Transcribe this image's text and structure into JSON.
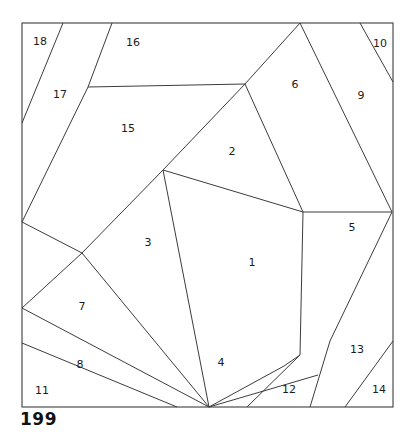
{
  "figure": {
    "caption": "199",
    "frame": {
      "x": 22,
      "y": 23,
      "width": 371,
      "height": 384
    },
    "stroke_color": "#3c3c3c",
    "fill_color": "#ffffff",
    "label_color": "#1b1b1b",
    "region_count": 18
  },
  "chart_data": {
    "type": "diagram",
    "title": "199",
    "regions": [
      {
        "id": "1",
        "label": "1",
        "label_x": 252,
        "label_y": 263,
        "points": "163,170 303,212 300,355 284,366 209,407"
      },
      {
        "id": "2",
        "label": "2",
        "label_x": 232,
        "label_y": 152,
        "points": "163,170 245,84 303,212"
      },
      {
        "id": "3",
        "label": "3",
        "label_x": 148,
        "label_y": 243,
        "points": "163,170 82,253 209,407"
      },
      {
        "id": "4",
        "label": "4",
        "label_x": 221,
        "label_y": 363,
        "points": "209,407 284,366 300,355 318,375 209,407"
      },
      {
        "id": "5",
        "label": "5",
        "label_x": 352,
        "label_y": 228,
        "points": "303,212 392,212 330,341 300,355"
      },
      {
        "id": "6",
        "label": "6",
        "label_x": 295,
        "label_y": 85,
        "points": "245,84 300,23 338,212 303,212"
      },
      {
        "id": "7",
        "label": "7",
        "label_x": 82,
        "label_y": 307,
        "points": "82,253 22,308 209,407"
      },
      {
        "id": "8",
        "label": "8",
        "label_x": 80,
        "label_y": 365,
        "points": "22,308 22,343 177,407 209,407"
      },
      {
        "id": "9",
        "label": "9",
        "label_x": 361,
        "label_y": 96,
        "points": "300,23 360,23 392,212 338,212"
      },
      {
        "id": "10",
        "label": "10",
        "label_x": 380,
        "label_y": 44,
        "points": "360,23 393,23 393,82"
      },
      {
        "id": "11",
        "label": "11",
        "label_x": 42,
        "label_y": 391,
        "points": "22,343 22,407 177,407"
      },
      {
        "id": "12",
        "label": "12",
        "label_x": 289,
        "label_y": 390,
        "points": "318,375 300,355 310,407 247,407"
      },
      {
        "id": "13",
        "label": "13",
        "label_x": 357,
        "label_y": 350,
        "points": "330,341 392,212 393,341 345,407 310,407"
      },
      {
        "id": "14",
        "label": "14",
        "label_x": 379,
        "label_y": 390,
        "points": "393,341 393,407 345,407"
      },
      {
        "id": "15",
        "label": "15",
        "label_x": 128,
        "label_y": 129,
        "points": "88,87 245,84 163,170 82,253 22,222"
      },
      {
        "id": "16",
        "label": "16",
        "label_x": 133,
        "label_y": 43,
        "points": "88,87 112,23 300,23 245,84"
      },
      {
        "id": "17",
        "label": "17",
        "label_x": 60,
        "label_y": 95,
        "points": "63,23 112,23 88,87 22,222 22,123"
      },
      {
        "id": "18",
        "label": "18",
        "label_x": 40,
        "label_y": 42,
        "points": "22,23 63,23 22,123"
      }
    ],
    "edges": [
      {
        "name": "edge-18-17",
        "points": "63,23 22,123"
      },
      {
        "name": "edge-17-16",
        "points": "112,23 88,87 22,222"
      },
      {
        "name": "edge-16-15",
        "points": "88,87 245,84"
      },
      {
        "name": "edge-15-3",
        "points": "22,222 82,253"
      },
      {
        "name": "edge-15-2",
        "points": "245,84 163,170"
      },
      {
        "name": "edge-15-3b",
        "points": "163,170 82,253"
      },
      {
        "name": "edge-2-6",
        "points": "245,84 300,23"
      },
      {
        "name": "edge-6-9",
        "points": "300,23 392,212"
      },
      {
        "name": "edge-9-10",
        "points": "360,23 393,82"
      },
      {
        "name": "edge-2-1",
        "points": "163,170 303,212"
      },
      {
        "name": "edge-2-6b",
        "points": "245,84 303,212"
      },
      {
        "name": "edge-1-5",
        "points": "303,212 392,212"
      },
      {
        "name": "edge-1-5b",
        "points": "303,212 300,355"
      },
      {
        "name": "edge-5-13",
        "points": "392,212 330,341 310,407"
      },
      {
        "name": "edge-3-1",
        "points": "163,170 209,407"
      },
      {
        "name": "edge-3-7",
        "points": "82,253 209,407"
      },
      {
        "name": "edge-7-boundary",
        "points": "82,253 22,308"
      },
      {
        "name": "edge-7-8",
        "points": "22,308 209,407"
      },
      {
        "name": "edge-8-11",
        "points": "22,343 177,407"
      },
      {
        "name": "edge-1-4",
        "points": "300,355 284,366 209,407"
      },
      {
        "name": "edge-4-12",
        "points": "318,375 209,407"
      },
      {
        "name": "edge-12-13",
        "points": "300,355 247,407"
      },
      {
        "name": "edge-13-14",
        "points": "393,341 345,407"
      }
    ]
  }
}
